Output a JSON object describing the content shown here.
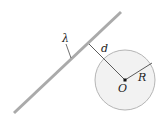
{
  "diagram": {
    "labels": {
      "line_charge": "λ",
      "distance": "d",
      "center": "O",
      "radius": "R"
    },
    "colors": {
      "rod": "#aaaaaa",
      "circle_fill": "#f2f2f2",
      "circle_stroke": "#b5b5b5",
      "lines": "#333333"
    }
  }
}
